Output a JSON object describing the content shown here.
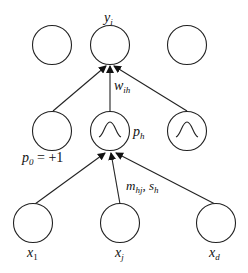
{
  "diagram": {
    "layers": {
      "output": {
        "nodes": [
          {
            "id": "out_1",
            "label": ""
          },
          {
            "id": "out_i",
            "label": "y",
            "sub": "i"
          },
          {
            "id": "out_k",
            "label": ""
          }
        ]
      },
      "hidden": {
        "nodes": [
          {
            "id": "bias",
            "label": "p",
            "sub": "0",
            "suffix": " = +1",
            "gaussian": false
          },
          {
            "id": "hidden_h",
            "label": "p",
            "sub": "h",
            "gaussian": true
          },
          {
            "id": "hidden_H",
            "label": "",
            "gaussian": true
          }
        ]
      },
      "input": {
        "nodes": [
          {
            "id": "x_1",
            "label": "x",
            "sub": "1"
          },
          {
            "id": "x_j",
            "label": "x",
            "sub": "j"
          },
          {
            "id": "x_d",
            "label": "x",
            "sub": "d"
          }
        ]
      }
    },
    "edge_labels": {
      "hidden_to_output": {
        "label": "w",
        "sub": "ih"
      },
      "input_to_hidden": {
        "label_m": "m",
        "sub_m": "hj",
        "sep": ", ",
        "label_s": "s",
        "sub_s": "h"
      }
    }
  }
}
